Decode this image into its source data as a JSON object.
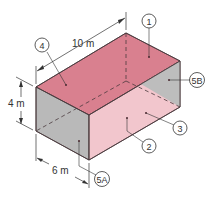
{
  "diagram": {
    "colors": {
      "top_face": "#d9808f",
      "right_face": "#f2c6cd",
      "left_face": "#b9b9b9",
      "back_wall": "#bdbdbd",
      "edge": "#4a3a3d",
      "annotation": "#333333"
    },
    "dimensions": {
      "length": "10 m",
      "height": "4 m",
      "width": "6 m"
    },
    "callouts": [
      {
        "id": "1",
        "label": "1"
      },
      {
        "id": "2",
        "label": "2"
      },
      {
        "id": "3",
        "label": "3"
      },
      {
        "id": "4",
        "label": "4"
      },
      {
        "id": "5A",
        "label": "5A"
      },
      {
        "id": "5B",
        "label": "5B"
      }
    ]
  }
}
